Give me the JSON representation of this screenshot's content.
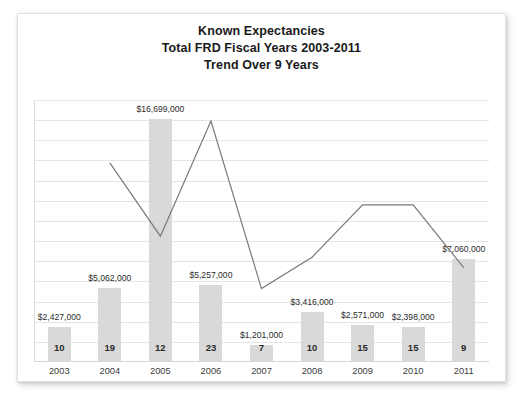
{
  "card": {
    "title_lines": [
      "Known Expectancies",
      "Total FRD Fiscal Years 2003-2011",
      "Trend Over 9 Years"
    ]
  },
  "colors": {
    "bar_fill": "#d9d9d9",
    "line_stroke": "#7a7a7a",
    "gridline": "#e4e4e4",
    "text": "#2b2b2b",
    "card_background": "#ffffff"
  },
  "chart_data": {
    "type": "bar",
    "title": "Known Expectancies Total FRD Fiscal Years 2003-2011 Trend Over 9 Years",
    "xlabel": "",
    "ylabel": "",
    "grid": true,
    "legend": "none",
    "gridline_count": 13,
    "categories": [
      "2003",
      "2004",
      "2005",
      "2006",
      "2007",
      "2008",
      "2009",
      "2010",
      "2011"
    ],
    "series": [
      {
        "name": "Amount",
        "type": "bar",
        "values": [
          2427000,
          5062000,
          16699000,
          5257000,
          1201000,
          3416000,
          2571000,
          2398000,
          7060000
        ],
        "labels": [
          "$2,427,000",
          "$5,062,000",
          "$16,699,000",
          "$5,257,000",
          "$1,201,000",
          "$3,416,000",
          "$2,571,000",
          "$2,398,000",
          "$7,060,000"
        ]
      },
      {
        "name": "Count",
        "type": "line",
        "values": [
          10,
          19,
          12,
          23,
          7,
          10,
          15,
          15,
          9
        ],
        "labels": [
          "10",
          "19",
          "12",
          "23",
          "7",
          "10",
          "15",
          "15",
          "9"
        ]
      }
    ],
    "ylim": [
      0,
      18000000
    ]
  }
}
